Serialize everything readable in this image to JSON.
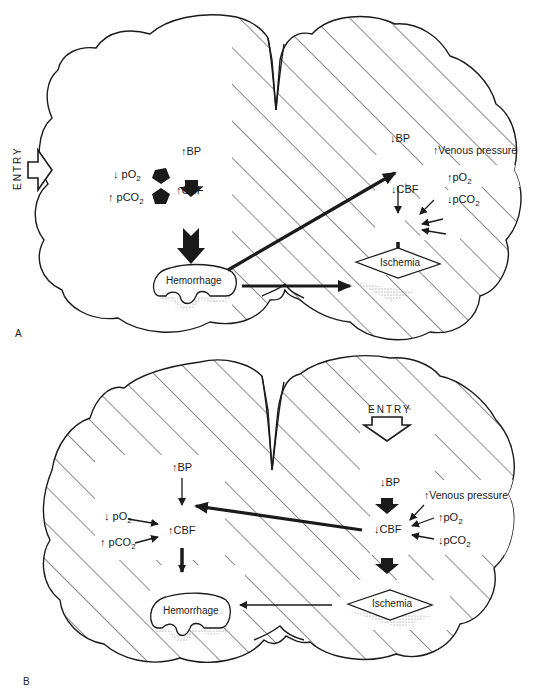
{
  "figure": {
    "panels": [
      {
        "id": "A",
        "letter": "A",
        "entry_label": "ENTRY",
        "entry_side": "left",
        "left_hemisphere": {
          "shading": "none",
          "bp": "BP",
          "bp_dir": "↑",
          "cbf": "CBF",
          "cbf_dir": "↑",
          "po2": "pO",
          "po2_sub": "2",
          "po2_dir": "↓",
          "pco2": "pCO",
          "pco2_sub": "2",
          "pco2_dir": "↑",
          "lesion": "Hemorrhage"
        },
        "right_hemisphere": {
          "shading": "hatched",
          "bp": "BP",
          "bp_dir": "↓",
          "cbf": "CBF",
          "cbf_dir": "↓",
          "venous": "Venous pressure",
          "venous_dir": "↑",
          "po2": "pO",
          "po2_sub": "2",
          "po2_dir": "↑",
          "pco2": "pCO",
          "pco2_sub": "2",
          "pco2_dir": "↓",
          "lesion": "Ischemia"
        }
      },
      {
        "id": "B",
        "letter": "B",
        "entry_label": "ENTRY",
        "entry_side": "top-right",
        "left_hemisphere": {
          "shading": "hatched",
          "bp": "BP",
          "bp_dir": "↑",
          "cbf": "CBF",
          "cbf_dir": "↑",
          "po2": "pO",
          "po2_sub": "2",
          "po2_dir": "↓",
          "pco2": "pCO",
          "pco2_sub": "2",
          "pco2_dir": "↑",
          "lesion": "Hemorrhage"
        },
        "right_hemisphere": {
          "shading": "hatched",
          "bp": "BP",
          "bp_dir": "↓",
          "cbf": "CBF",
          "cbf_dir": "↓",
          "venous": "Venous pressure",
          "venous_dir": "↑",
          "po2": "pO",
          "po2_sub": "2",
          "po2_dir": "↑",
          "pco2": "pCO",
          "pco2_sub": "2",
          "pco2_dir": "↓",
          "lesion": "Ischemia"
        }
      }
    ],
    "colors": {
      "ink": "#1a1a1a",
      "background": "#ffffff"
    }
  }
}
